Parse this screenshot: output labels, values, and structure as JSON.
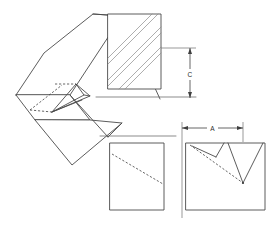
{
  "drawing": {
    "title": "V-Notch Groove Technical Drawing",
    "background_color": "#ffffff",
    "line_color": "#4a4a4a",
    "hidden_line_color": "#3f3f3f",
    "hatch_color": "#8a8a8a",
    "dimension_color": "#3f3f3f"
  },
  "dimensions": [
    {
      "id": "C",
      "label": "C",
      "orientation": "vertical",
      "description": "height of hatched section view",
      "x": 190,
      "y_top": 48,
      "y_bottom": 98,
      "text_x": 190,
      "text_y": 75
    },
    {
      "id": "A",
      "label": "A",
      "orientation": "horizontal",
      "description": "width across V-notch opening in front view",
      "y": 128,
      "x_left": 182,
      "x_right": 243,
      "text_x": 212,
      "text_y": 129
    }
  ],
  "views": [
    {
      "id": "isometric-view",
      "name": "isometric-view",
      "description": "Pictorial 3D view of block with V-notch groove"
    },
    {
      "id": "section-view-hatched",
      "name": "section-view-hatched",
      "description": "Hatched rectangular section view, dimension C",
      "hatch_line_count": 6
    },
    {
      "id": "side-view",
      "name": "side-view",
      "description": "Side view rectangle with hidden diagonal line"
    },
    {
      "id": "front-view",
      "name": "front-view",
      "description": "Front view rectangle with V-notch lines, dimension A"
    }
  ]
}
